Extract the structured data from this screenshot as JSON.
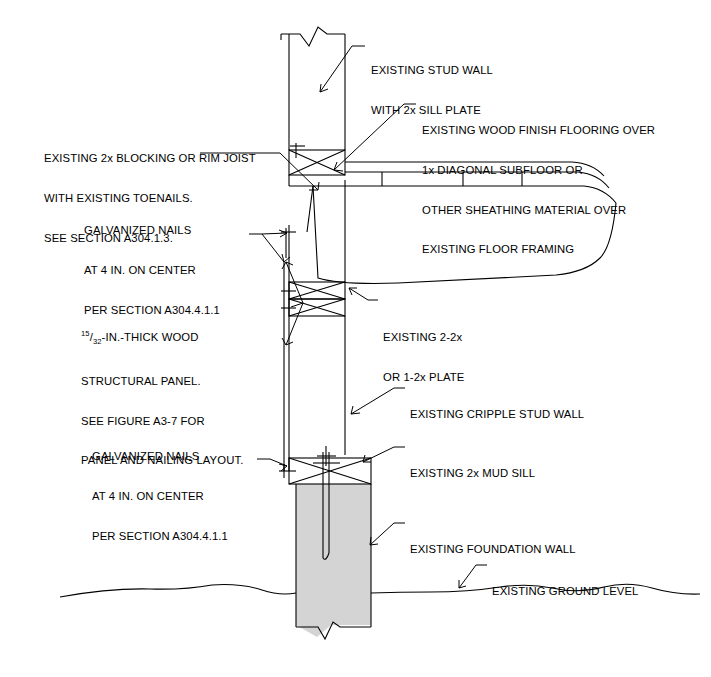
{
  "figure": {
    "type": "architectural-section-detail",
    "background_color": "#ffffff",
    "line_color": "#000000",
    "foundation_fill": "#d4d4d4"
  },
  "annotations": [
    {
      "id": "existing-stud-wall",
      "lines": [
        "EXISTING STUD WALL",
        "WITH 2x SILL PLATE"
      ],
      "x": 371,
      "y": 38
    },
    {
      "id": "existing-wood-finish-flooring",
      "lines": [
        "EXISTING WOOD FINISH FLOORING OVER",
        "1x DIAGONAL SUBFLOOR OR",
        "OTHER SHEATHING MATERIAL OVER",
        "EXISTING FLOOR FRAMING"
      ],
      "x": 422,
      "y": 98
    },
    {
      "id": "existing-blocking-rim-joist",
      "lines": [
        "EXISTING 2x BLOCKING OR RIM JOIST",
        "WITH EXISTING TOENAILS.",
        "SEE SECTION A304.1.3."
      ],
      "x": 44,
      "y": 126
    },
    {
      "id": "galvanized-nails-upper",
      "lines": [
        "GALVANIZED NAILS",
        "AT 4 IN. ON CENTER",
        "PER SECTION A304.4.1.1"
      ],
      "x": 84,
      "y": 198
    },
    {
      "id": "wood-structural-panel",
      "lines": [
        "-IN.-THICK WOOD",
        "STRUCTURAL PANEL.",
        "SEE FIGURE A3-7 FOR",
        "PANEL AND NAILING LAYOUT."
      ],
      "fraction_numerator": "15",
      "fraction_denominator": "32",
      "x": 81,
      "y": 301
    },
    {
      "id": "existing-plate",
      "lines": [
        "EXISTING 2-2x",
        "OR 1-2x PLATE"
      ],
      "x": 383,
      "y": 305
    },
    {
      "id": "existing-cripple-stud-wall",
      "lines": [
        "EXISTING CRIPPLE STUD WALL"
      ],
      "x": 410,
      "y": 382
    },
    {
      "id": "galvanized-nails-lower",
      "lines": [
        "GALVANIZED NAILS",
        "AT 4 IN. ON CENTER",
        "PER SECTION A304.4.1.1"
      ],
      "x": 92,
      "y": 424
    },
    {
      "id": "existing-mud-sill",
      "lines": [
        "EXISTING 2x MUD SILL"
      ],
      "x": 410,
      "y": 441
    },
    {
      "id": "existing-foundation-wall",
      "lines": [
        "EXISTING FOUNDATION WALL"
      ],
      "x": 410,
      "y": 517
    },
    {
      "id": "existing-ground-level",
      "lines": [
        "EXISTING GROUND LEVEL"
      ],
      "x": 492,
      "y": 559
    }
  ]
}
